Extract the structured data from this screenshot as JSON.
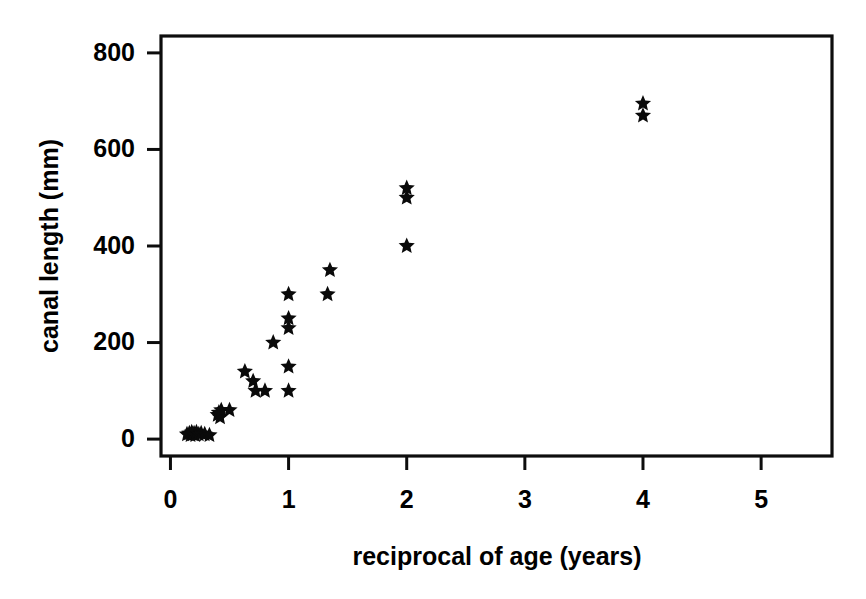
{
  "figure": {
    "background_color": "#ffffff",
    "ink_color": "#000000",
    "width": 866,
    "height": 599
  },
  "chart_data": {
    "type": "scatter",
    "title": "",
    "subtitle": "",
    "xlabel": "reciprocal of age (years)",
    "ylabel": "canal length (mm)",
    "xlim": [
      -0.08,
      5.6
    ],
    "ylim": [
      -35,
      835
    ],
    "xticks": [
      0,
      1,
      2,
      3,
      4,
      5
    ],
    "xticklabels": [
      "0",
      "1",
      "2",
      "3",
      "4",
      "5"
    ],
    "yticks": [
      0,
      200,
      400,
      600,
      800
    ],
    "yticklabels": [
      "0",
      "200",
      "400",
      "600",
      "800"
    ],
    "grid": false,
    "legend": null,
    "marker": "star",
    "marker_color": "#0a0a0a",
    "marker_size": 11,
    "series": [
      {
        "name": "canal length vs reciprocal of age",
        "points": [
          [
            0.14,
            10
          ],
          [
            0.16,
            12
          ],
          [
            0.17,
            8
          ],
          [
            0.18,
            14
          ],
          [
            0.19,
            10
          ],
          [
            0.2,
            12
          ],
          [
            0.21,
            8
          ],
          [
            0.22,
            14
          ],
          [
            0.24,
            10
          ],
          [
            0.26,
            12
          ],
          [
            0.29,
            10
          ],
          [
            0.33,
            8
          ],
          [
            0.4,
            50
          ],
          [
            0.41,
            55
          ],
          [
            0.42,
            45
          ],
          [
            0.43,
            60
          ],
          [
            0.5,
            60
          ],
          [
            0.63,
            140
          ],
          [
            0.7,
            120
          ],
          [
            0.72,
            100
          ],
          [
            0.8,
            100
          ],
          [
            0.87,
            200
          ],
          [
            1.0,
            100
          ],
          [
            1.0,
            150
          ],
          [
            1.0,
            230
          ],
          [
            1.0,
            250
          ],
          [
            1.0,
            300
          ],
          [
            1.33,
            300
          ],
          [
            1.35,
            350
          ],
          [
            2.0,
            400
          ],
          [
            2.0,
            500
          ],
          [
            2.0,
            520
          ],
          [
            4.0,
            670
          ],
          [
            4.0,
            695
          ]
        ]
      }
    ]
  },
  "axes": {
    "x_axis_name": "reciprocal-of-age-axis",
    "y_axis_name": "canal-length-axis"
  }
}
